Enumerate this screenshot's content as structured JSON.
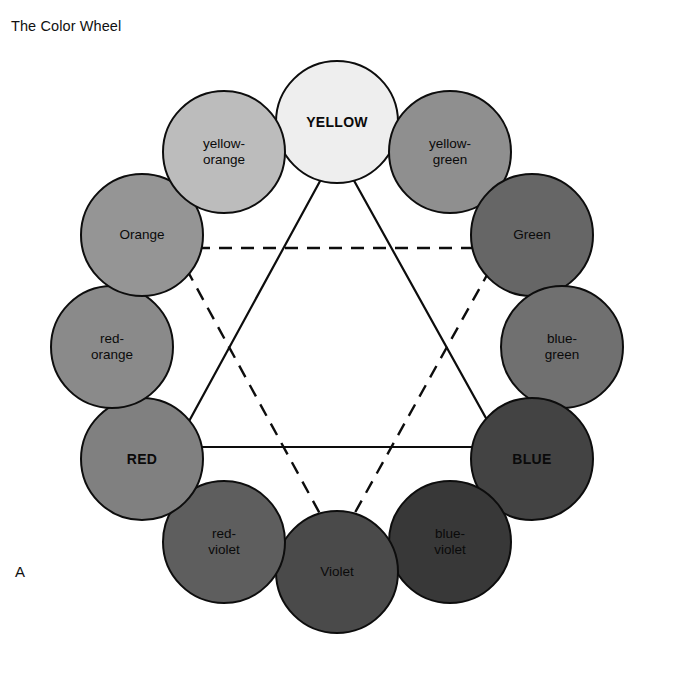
{
  "figure": {
    "title": "The Color Wheel",
    "panel_label": "A",
    "background_color": "#ffffff",
    "outline_color": "#0d0d0d",
    "text_color": "#0a0a0a",
    "width": 677,
    "height": 682
  },
  "wheel": {
    "center": {
      "x": 337,
      "y": 347
    },
    "ring_radius": 225,
    "swatch_radius": 62,
    "swatches": [
      {
        "label": "YELLOW",
        "kind": "primary",
        "angle_deg": 90,
        "color": "#eeeeee",
        "cx": 337,
        "cy": 122
      },
      {
        "label": "yellow-green",
        "kind": "tertiary",
        "angle_deg": 60,
        "color": "#8f8f8f",
        "cx": 450,
        "cy": 152
      },
      {
        "label": "Green",
        "kind": "secondary",
        "angle_deg": 30,
        "color": "#666666",
        "cx": 532,
        "cy": 235
      },
      {
        "label": "blue-green",
        "kind": "tertiary",
        "angle_deg": 0,
        "color": "#707070",
        "cx": 562,
        "cy": 347
      },
      {
        "label": "BLUE",
        "kind": "primary",
        "angle_deg": -30,
        "color": "#434343",
        "cx": 532,
        "cy": 459
      },
      {
        "label": "blue-violet",
        "kind": "tertiary",
        "angle_deg": -60,
        "color": "#383838",
        "cx": 450,
        "cy": 542
      },
      {
        "label": "Violet",
        "kind": "secondary",
        "angle_deg": -90,
        "color": "#4a4a4a",
        "cx": 337,
        "cy": 572
      },
      {
        "label": "red-violet",
        "kind": "tertiary",
        "angle_deg": -120,
        "color": "#5e5e5e",
        "cx": 224,
        "cy": 542
      },
      {
        "label": "RED",
        "kind": "primary",
        "angle_deg": -150,
        "color": "#808080",
        "cx": 142,
        "cy": 459
      },
      {
        "label": "red-orange",
        "kind": "tertiary",
        "angle_deg": 180,
        "color": "#8a8a8a",
        "cx": 112,
        "cy": 347
      },
      {
        "label": "Orange",
        "kind": "secondary",
        "angle_deg": 150,
        "color": "#959595",
        "cx": 142,
        "cy": 235
      },
      {
        "label": "yellow-orange",
        "kind": "tertiary",
        "angle_deg": 120,
        "color": "#bcbcbc",
        "cx": 224,
        "cy": 152
      }
    ]
  },
  "triangles": {
    "primary_triangle": {
      "style": "solid",
      "stroke": "#0d0d0d",
      "connects": [
        "YELLOW",
        "RED",
        "BLUE"
      ],
      "points": "337,150 175,447 502,447"
    },
    "secondary_triangle": {
      "style": "dashed",
      "stroke": "#0d0d0d",
      "connects": [
        "Orange",
        "Green",
        "Violet"
      ],
      "points": "175,248 502,248 337,545"
    }
  }
}
